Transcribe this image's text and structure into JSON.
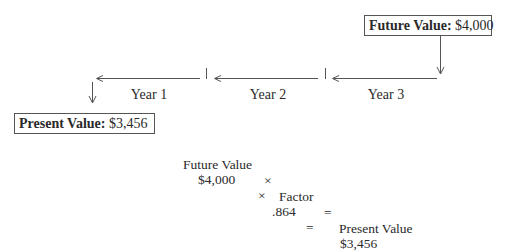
{
  "future_value_box": {
    "label": "Future Value:",
    "value": "$4,000"
  },
  "present_value_box": {
    "label": "Present Value:",
    "value": "$3,456"
  },
  "timeline": {
    "direction": "right-to-left",
    "segments": [
      {
        "label": "Year 1"
      },
      {
        "label": "Year 2"
      },
      {
        "label": "Year 3"
      }
    ]
  },
  "formula": {
    "line1": {
      "term1": "Future Value",
      "op1": "×",
      "term2": "Factor",
      "op2": "=",
      "term3": "Present Value"
    },
    "line2": {
      "term1": "$4,000",
      "op1": "×",
      "term2": ".864",
      "op2": "=",
      "term3": "$3,456"
    }
  },
  "colors": {
    "line": "#555555",
    "text": "#2a2a2a",
    "box_border": "#555555"
  }
}
